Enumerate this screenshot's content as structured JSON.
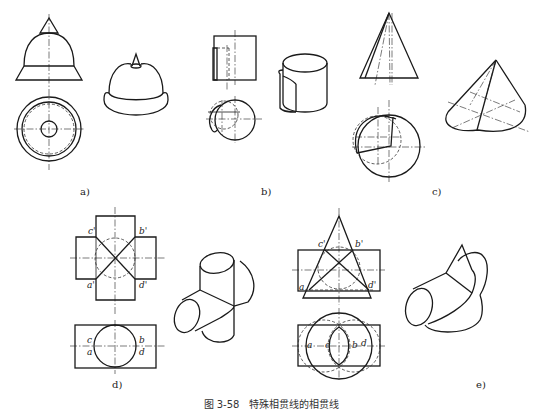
{
  "figure": {
    "caption": "图 3-58　特殊相贯线的相贯线",
    "panels": [
      {
        "id": "a",
        "label": "a)",
        "description": "Revolved body: cone tip on hemisphere on truncated cone base — front & top views plus pictorial"
      },
      {
        "id": "b",
        "label": "b)",
        "description": "Two coaxial-offset cylinders — front & top views plus pictorial"
      },
      {
        "id": "c",
        "label": "c)",
        "description": "Two cones sharing apex — front & top views plus pictorial"
      },
      {
        "id": "d",
        "label": "d)",
        "description": "Two equal-diameter cylinders intersecting at right angles — front & top views plus pictorial",
        "points_front": [
          "c'",
          "b'",
          "a'",
          "d'"
        ],
        "points_top": [
          "c",
          "a",
          "b",
          "d"
        ]
      },
      {
        "id": "e",
        "label": "e)",
        "description": "Cylinder intersecting cone, both circumscribing a common sphere — front & top views plus pictorial",
        "points_front": [
          "c'",
          "b'",
          "a",
          "d'"
        ],
        "points_top": [
          "a",
          "c",
          "b",
          "d"
        ]
      }
    ]
  }
}
